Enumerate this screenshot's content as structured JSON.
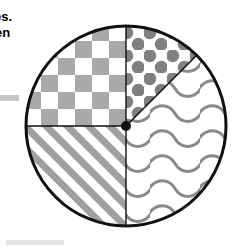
{
  "page": {
    "background_color": "#ffffff",
    "width": 245,
    "height": 249
  },
  "side_text": {
    "line1": "es.",
    "line2": "en",
    "note": "text clipped at left edge of image"
  },
  "decorations": {
    "gray_bar_color": "#c6c6c6",
    "bottom_bar_color": "#e2e2e2"
  },
  "chart_data": {
    "type": "pie",
    "title": "",
    "xlabel": "",
    "ylabel": "",
    "center_x": 126,
    "center_y": 126,
    "radius": 100,
    "outline_color": "#111111",
    "outline_width": 3,
    "divider_color": "#111111",
    "divider_width": 1.4,
    "center_dot_color": "#111111",
    "center_dot_radius": 5,
    "pattern_color": "#8f8f8f",
    "fill_color": "#ffffff",
    "categories": [
      "checkerboard",
      "dots",
      "waves",
      "diagonal-stripes"
    ],
    "values": [
      25,
      25,
      25,
      25
    ],
    "slices": [
      {
        "label": "checkerboard",
        "pattern": "checkerboard",
        "start_angle_deg": 90,
        "end_angle_deg": 180,
        "fraction": 0.25,
        "swatch_color": "#a9a9a9",
        "cell_size": 17
      },
      {
        "label": "dots",
        "pattern": "dots",
        "start_angle_deg": 45,
        "end_angle_deg": 90,
        "fraction": 0.125,
        "swatch_color": "#808080",
        "dot_radius": 6.5,
        "dot_spacing": 23
      },
      {
        "label": "waves",
        "pattern": "waves",
        "start_angle_deg": -90,
        "end_angle_deg": 45,
        "fraction": 0.375,
        "swatch_color": "#8a8a8a",
        "wave_spacing": 25,
        "wave_length": 50,
        "stroke_width": 3
      },
      {
        "label": "diagonal-stripes",
        "pattern": "diagonal-stripes",
        "start_angle_deg": 180,
        "end_angle_deg": 270,
        "fraction": 0.25,
        "swatch_color": "#a0a0a0",
        "stripe_width": 7,
        "stripe_spacing": 15
      }
    ],
    "dividers": [
      {
        "name": "vertical-diameter",
        "from": [
          126,
          26
        ],
        "to": [
          126,
          226
        ]
      },
      {
        "name": "horizontal-radius-left",
        "from": [
          126,
          126
        ],
        "to": [
          26,
          126
        ]
      },
      {
        "name": "diagonal-radius-upper-right",
        "from": [
          126,
          126
        ],
        "to": [
          196.7,
          55.3
        ]
      }
    ],
    "grid": false,
    "legend": "none"
  }
}
